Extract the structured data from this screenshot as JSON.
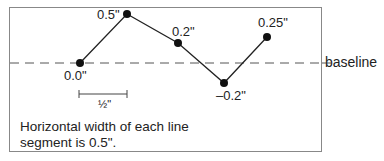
{
  "diagram": {
    "baseline_label": "baseline",
    "points": [
      {
        "label": "0.0\"",
        "value": 0.0
      },
      {
        "label": "0.5\"",
        "value": 0.5
      },
      {
        "label": "0.2\"",
        "value": 0.2
      },
      {
        "label": "–0.2\"",
        "value": -0.2
      },
      {
        "label": "0.25\"",
        "value": 0.25
      }
    ],
    "scale_label": "½\"",
    "caption_line1": "Horizontal width of each line",
    "caption_line2": "segment is 0.5\"."
  }
}
